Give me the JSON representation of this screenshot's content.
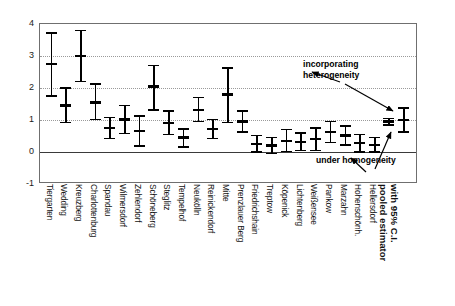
{
  "axes": {
    "y_ticks": [
      4,
      3,
      2,
      1,
      0,
      -1
    ],
    "y_min": -1,
    "y_max": 4,
    "gridlines_at": [
      3,
      2,
      1
    ],
    "zero_line_at": 0
  },
  "annotations": {
    "heterogeneity": "incorporating\nheterogeneity",
    "homogeneity": "under homogeneity"
  },
  "chart_data": {
    "type": "scatter",
    "title": "",
    "xlabel": "",
    "ylabel": "",
    "ylim": [
      -1,
      4
    ],
    "grid": true,
    "legend": "none",
    "series": [
      {
        "name": "district estimate with 95% C.I.",
        "categories": [
          "Tiergarten",
          "Wedding",
          "Kreuzberg",
          "Charlottenburg",
          "Spandau",
          "Wilmersdorf",
          "Zehlendorf",
          "Schöneberg",
          "Steglitz",
          "Tempelhof",
          "Neukölln",
          "Reinickendorf",
          "Mitte",
          "Prenzlauer Berg",
          "Friedrichshain",
          "Treptow",
          "Köpenick",
          "Lichtenberg",
          "Weißensee",
          "Pankow",
          "Marzahn",
          "Hohenschönh.",
          "Hellersdorf"
        ],
        "values": [
          2.75,
          1.45,
          3.0,
          1.55,
          0.75,
          1.02,
          0.65,
          2.05,
          0.9,
          0.45,
          1.32,
          0.72,
          1.8,
          0.95,
          0.25,
          0.2,
          0.35,
          0.32,
          0.4,
          0.62,
          0.52,
          0.28,
          0.22
        ],
        "ci_lower": [
          1.75,
          0.92,
          2.2,
          1.02,
          0.42,
          0.58,
          0.18,
          1.32,
          0.55,
          0.15,
          0.95,
          0.42,
          0.92,
          0.62,
          0.0,
          -0.05,
          0.02,
          0.05,
          0.05,
          0.3,
          0.22,
          0.0,
          0.0
        ],
        "ci_upper": [
          3.72,
          2.0,
          3.8,
          2.12,
          1.08,
          1.45,
          1.12,
          2.7,
          1.28,
          0.72,
          1.7,
          1.02,
          2.62,
          1.28,
          0.52,
          0.45,
          0.7,
          0.6,
          0.75,
          0.95,
          0.82,
          0.55,
          0.45
        ]
      },
      {
        "name": "pooled estimator with 95% C.I.",
        "categories": [
          "under homogeneity",
          "incorporating heterogeneity"
        ],
        "values": [
          0.95,
          1.0
        ],
        "ci_lower": [
          0.85,
          0.62
        ],
        "ci_upper": [
          1.05,
          1.38
        ]
      }
    ],
    "pooled_label": "pooled estimator\nwith 95% C.I."
  },
  "xaxis": {
    "labels": [
      "Tiergarten",
      "Wedding",
      "Kreuzberg",
      "Charlottenburg",
      "Spandau",
      "Wilmersdorf",
      "Zehlendorf",
      "Schöneberg",
      "Steglitz",
      "Tempelhof",
      "Neukölln",
      "Reinickendorf",
      "Mitte",
      "Prenzlauer Berg",
      "Friedrichshain",
      "Treptow",
      "Köpenick",
      "Lichtenberg",
      "Weißensee",
      "Pankow",
      "Marzahn",
      "Hohenschönh.",
      "Hellersdorf"
    ],
    "pooled_label_line1": "pooled estimator",
    "pooled_label_line2": "with 95% C.I."
  },
  "colors": {
    "marker": "#000000",
    "grid": "#9a9a9a",
    "frame": "#6f6f6f",
    "zero": "#3a3a3a",
    "text": "#111111"
  }
}
